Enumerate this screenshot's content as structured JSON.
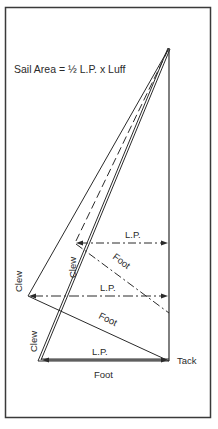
{
  "diagram": {
    "formula": "Sail Area = ½ L.P. x Luff",
    "labels": {
      "tack": "Tack",
      "sail_dashed": {
        "clew": "Clew",
        "foot": "Foot",
        "lp": "L.P."
      },
      "sail_single": {
        "clew": "Clew",
        "foot": "Foot",
        "lp": "L.P."
      },
      "sail_double": {
        "clew": "Clew",
        "foot": "Foot",
        "lp": "L.P."
      }
    },
    "colors": {
      "line": "#2a2a2a",
      "frame": "#3a3a3a",
      "background": "#ffffff"
    }
  }
}
